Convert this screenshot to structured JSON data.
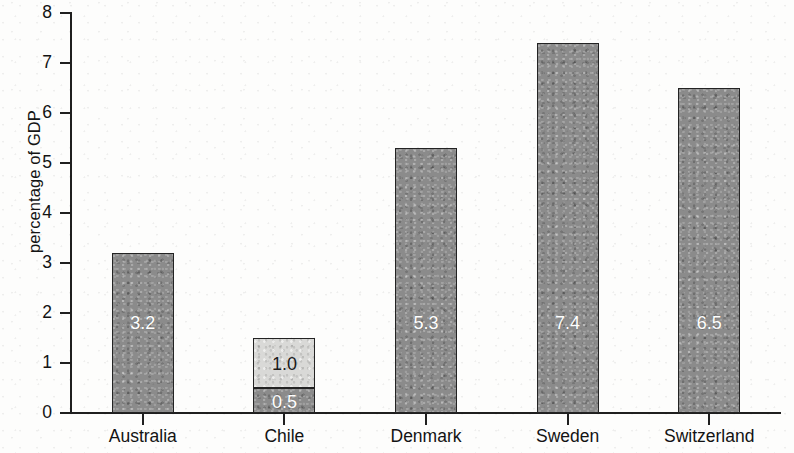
{
  "chart_data": {
    "type": "bar",
    "title": "",
    "subtitle": "",
    "xlabel": "",
    "ylabel": "percentage of GDP",
    "ylim": [
      0,
      8
    ],
    "ytick_labels": [
      "0",
      "1",
      "2",
      "3",
      "4",
      "5",
      "6",
      "7",
      "8"
    ],
    "ytick_values": [
      0,
      1,
      2,
      3,
      4,
      5,
      6,
      7,
      8
    ],
    "grid": false,
    "legend_position": "none",
    "stacked": true,
    "categories": [
      "Australia",
      "Chile",
      "Denmark",
      "Sweden",
      "Switzerland"
    ],
    "series": [
      {
        "name": "lower segment",
        "color": "#8b8b8b",
        "values": [
          3.2,
          0.5,
          5.3,
          7.4,
          6.5
        ],
        "labels": [
          "3.2",
          "0.5",
          "5.3",
          "7.4",
          "6.5"
        ]
      },
      {
        "name": "upper segment",
        "color": "#d9d9d7",
        "values": [
          0,
          1.0,
          0,
          0,
          0
        ],
        "labels": [
          "",
          "1.0",
          "",
          "",
          ""
        ]
      }
    ],
    "totals": [
      3.2,
      1.5,
      5.3,
      7.4,
      6.5
    ]
  },
  "colors": {
    "bar_dark": "#8b8b8b",
    "bar_light": "#d9d9d7",
    "bar_outline": "#232323",
    "axis": "#1f1f1f",
    "text": "#131313",
    "value_label_on_dark": "#ffffff",
    "value_label_on_light": "#1b1b1b",
    "background": "#fdfdfc"
  }
}
